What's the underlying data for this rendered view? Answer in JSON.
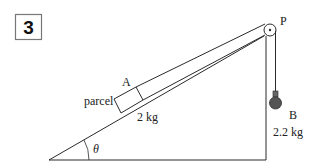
{
  "problem_number": "3",
  "labels": {
    "parcel": "parcel",
    "block_a": "A",
    "mass_a": "2 kg",
    "pulley": "P",
    "weight_b": "B",
    "mass_b": "2.2 kg",
    "angle": "θ"
  },
  "colors": {
    "stroke": "#2a2a2a",
    "weight_fill": "#555555",
    "background": "#ffffff"
  }
}
